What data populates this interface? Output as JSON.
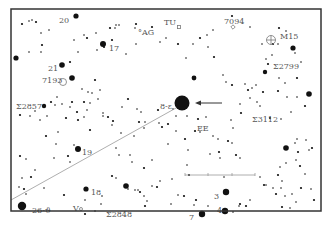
{
  "map": {
    "title": "Star finder chart",
    "frame": {
      "x": 11,
      "y": 9,
      "w": 310,
      "h": 202,
      "color": "#333333"
    },
    "ink_color": "#111111",
    "label_color": "#555555",
    "line_color": "#999999"
  },
  "labels": [
    {
      "id": "20",
      "text": "20",
      "x": 59,
      "y": 20
    },
    {
      "id": "AG",
      "text": "°AG",
      "x": 138,
      "y": 32
    },
    {
      "id": "TU",
      "text": "TU",
      "x": 164,
      "y": 22
    },
    {
      "id": "7094",
      "text": "7094",
      "x": 224,
      "y": 21
    },
    {
      "id": "M15",
      "text": "M15",
      "x": 280,
      "y": 36
    },
    {
      "id": "17",
      "text": "17",
      "x": 109,
      "y": 48
    },
    {
      "id": "21",
      "text": "21",
      "x": 48,
      "y": 68
    },
    {
      "id": "7193",
      "text": "7193",
      "x": 42,
      "y": 80
    },
    {
      "id": "S2799",
      "text": "Σ2799",
      "x": 273,
      "y": 66
    },
    {
      "id": "S2857",
      "text": "Σ2857",
      "x": 16,
      "y": 106
    },
    {
      "id": "8-eps",
      "text": "8-ε",
      "x": 160,
      "y": 106
    },
    {
      "id": "EE",
      "text": "EE",
      "x": 197,
      "y": 128
    },
    {
      "id": "S3112",
      "text": "Σ3112",
      "x": 252,
      "y": 119
    },
    {
      "id": "19",
      "text": "19",
      "x": 82,
      "y": 152
    },
    {
      "id": "18",
      "text": "18",
      "x": 91,
      "y": 192
    },
    {
      "id": "3",
      "text": "3",
      "x": 214,
      "y": 196
    },
    {
      "id": "V",
      "text": "V",
      "x": 73,
      "y": 208
    },
    {
      "id": "S2848",
      "text": "Σ2848",
      "x": 106,
      "y": 214
    },
    {
      "id": "26-theta",
      "text": "26-ϑ",
      "x": 32,
      "y": 210
    },
    {
      "id": "4",
      "text": "4",
      "x": 217,
      "y": 210
    },
    {
      "id": "7",
      "text": "7",
      "x": 189,
      "y": 217
    }
  ],
  "bright_stars": [
    {
      "x": 76,
      "y": 16,
      "r": 2.6
    },
    {
      "x": 103,
      "y": 44,
      "r": 3
    },
    {
      "x": 16,
      "y": 58,
      "r": 2.6
    },
    {
      "x": 62,
      "y": 65,
      "r": 2.8
    },
    {
      "x": 72,
      "y": 78,
      "r": 2.8
    },
    {
      "x": 182,
      "y": 103,
      "r": 7.5
    },
    {
      "x": 78,
      "y": 149,
      "r": 3
    },
    {
      "x": 22,
      "y": 206,
      "r": 4.2
    },
    {
      "x": 86,
      "y": 189,
      "r": 2.6
    },
    {
      "x": 126,
      "y": 186,
      "r": 2.8
    },
    {
      "x": 226,
      "y": 192,
      "r": 3.2
    },
    {
      "x": 225,
      "y": 211,
      "r": 3.2
    },
    {
      "x": 202,
      "y": 214,
      "r": 3.2
    },
    {
      "x": 293,
      "y": 48,
      "r": 2.6
    },
    {
      "x": 309,
      "y": 94,
      "r": 2.8
    },
    {
      "x": 286,
      "y": 148,
      "r": 2.8
    },
    {
      "x": 265,
      "y": 72,
      "r": 2.2
    },
    {
      "x": 194,
      "y": 78,
      "r": 2.4
    },
    {
      "x": 44,
      "y": 106,
      "r": 2.2
    }
  ],
  "faint_stars": [
    [
      22,
      24
    ],
    [
      29,
      21
    ],
    [
      32,
      20
    ],
    [
      36,
      22
    ],
    [
      41,
      33
    ],
    [
      49,
      30
    ],
    [
      42,
      45
    ],
    [
      41,
      52
    ],
    [
      29,
      52
    ],
    [
      70,
      62
    ],
    [
      78,
      52
    ],
    [
      74,
      40
    ],
    [
      87,
      38
    ],
    [
      84,
      35
    ],
    [
      96,
      33
    ],
    [
      110,
      28
    ],
    [
      116,
      25
    ],
    [
      119,
      25
    ],
    [
      136,
      24
    ],
    [
      135,
      28
    ],
    [
      136,
      44
    ],
    [
      104,
      47
    ],
    [
      97,
      50
    ],
    [
      126,
      54
    ],
    [
      152,
      27
    ],
    [
      166,
      38
    ],
    [
      160,
      42
    ],
    [
      178,
      44
    ],
    [
      186,
      58
    ],
    [
      193,
      44
    ],
    [
      200,
      38
    ],
    [
      208,
      47
    ],
    [
      213,
      30
    ],
    [
      232,
      16
    ],
    [
      250,
      27
    ],
    [
      262,
      44
    ],
    [
      273,
      44
    ],
    [
      278,
      44
    ],
    [
      286,
      31
    ],
    [
      279,
      28
    ],
    [
      272,
      55
    ],
    [
      266,
      59
    ],
    [
      268,
      64
    ],
    [
      295,
      53
    ],
    [
      301,
      62
    ],
    [
      297,
      78
    ],
    [
      285,
      83
    ],
    [
      279,
      78
    ],
    [
      278,
      91
    ],
    [
      287,
      97
    ],
    [
      297,
      97
    ],
    [
      305,
      106
    ],
    [
      291,
      112
    ],
    [
      281,
      119
    ],
    [
      270,
      118
    ],
    [
      260,
      106
    ],
    [
      257,
      102
    ],
    [
      248,
      90
    ],
    [
      252,
      88
    ],
    [
      256,
      85
    ],
    [
      263,
      92
    ],
    [
      250,
      98
    ],
    [
      207,
      35
    ],
    [
      214,
      57
    ],
    [
      223,
      75
    ],
    [
      226,
      82
    ],
    [
      232,
      85
    ],
    [
      245,
      84
    ],
    [
      240,
      104
    ],
    [
      241,
      113
    ],
    [
      231,
      120
    ],
    [
      206,
      117
    ],
    [
      198,
      119
    ],
    [
      187,
      116
    ],
    [
      176,
      116
    ],
    [
      168,
      124
    ],
    [
      213,
      136
    ],
    [
      218,
      139
    ],
    [
      228,
      141
    ],
    [
      232,
      143
    ],
    [
      240,
      158
    ],
    [
      236,
      155
    ],
    [
      233,
      128
    ],
    [
      176,
      131
    ],
    [
      185,
      139
    ],
    [
      188,
      150
    ],
    [
      187,
      165
    ],
    [
      189,
      175
    ],
    [
      172,
      179
    ],
    [
      178,
      195
    ],
    [
      184,
      196
    ],
    [
      171,
      204
    ],
    [
      194,
      205
    ],
    [
      196,
      200
    ],
    [
      208,
      206
    ],
    [
      233,
      212
    ],
    [
      240,
      204
    ],
    [
      239,
      206
    ],
    [
      260,
      177
    ],
    [
      264,
      185
    ],
    [
      266,
      185
    ],
    [
      273,
      188
    ],
    [
      278,
      175
    ],
    [
      282,
      181
    ],
    [
      281,
      188
    ],
    [
      276,
      194
    ],
    [
      285,
      196
    ],
    [
      292,
      194
    ],
    [
      301,
      188
    ],
    [
      296,
      202
    ],
    [
      290,
      208
    ],
    [
      282,
      207
    ],
    [
      295,
      143
    ],
    [
      297,
      139
    ],
    [
      298,
      152
    ],
    [
      306,
      140
    ],
    [
      309,
      150
    ],
    [
      312,
      148
    ],
    [
      88,
      92
    ],
    [
      92,
      93
    ],
    [
      95,
      80
    ],
    [
      100,
      90
    ],
    [
      82,
      89
    ],
    [
      84,
      102
    ],
    [
      90,
      103
    ],
    [
      87,
      110
    ],
    [
      77,
      112
    ],
    [
      70,
      107
    ],
    [
      57,
      97
    ],
    [
      51,
      102
    ],
    [
      55,
      105
    ],
    [
      62,
      104
    ],
    [
      72,
      102
    ],
    [
      47,
      116
    ],
    [
      35,
      111
    ],
    [
      20,
      115
    ],
    [
      30,
      116
    ],
    [
      122,
      107
    ],
    [
      128,
      99
    ],
    [
      137,
      109
    ],
    [
      141,
      112
    ],
    [
      113,
      121
    ],
    [
      112,
      125
    ],
    [
      134,
      136
    ],
    [
      139,
      122
    ],
    [
      145,
      122
    ],
    [
      159,
      123
    ],
    [
      162,
      127
    ],
    [
      119,
      155
    ],
    [
      130,
      155
    ],
    [
      144,
      168
    ],
    [
      152,
      160
    ],
    [
      168,
      144
    ],
    [
      20,
      156
    ],
    [
      26,
      159
    ],
    [
      35,
      170
    ],
    [
      31,
      177
    ],
    [
      22,
      178
    ],
    [
      19,
      187
    ],
    [
      24,
      189
    ],
    [
      26,
      194
    ],
    [
      44,
      188
    ],
    [
      64,
      195
    ],
    [
      85,
      200
    ],
    [
      102,
      196
    ],
    [
      85,
      214
    ],
    [
      101,
      204
    ],
    [
      95,
      211
    ],
    [
      112,
      176
    ],
    [
      116,
      178
    ],
    [
      128,
      189
    ],
    [
      140,
      192
    ],
    [
      144,
      196
    ],
    [
      147,
      201
    ],
    [
      145,
      206
    ],
    [
      135,
      190
    ],
    [
      138,
      190
    ],
    [
      157,
      187
    ],
    [
      160,
      181
    ],
    [
      152,
      186
    ],
    [
      112,
      40
    ],
    [
      115,
      28
    ],
    [
      98,
      99
    ],
    [
      90,
      130
    ],
    [
      116,
      148
    ],
    [
      132,
      162
    ],
    [
      46,
      136
    ],
    [
      56,
      144
    ],
    [
      54,
      158
    ],
    [
      68,
      156
    ],
    [
      70,
      162
    ],
    [
      74,
      145
    ],
    [
      78,
      120
    ],
    [
      58,
      132
    ],
    [
      40,
      120
    ],
    [
      66,
      118
    ],
    [
      84,
      117
    ],
    [
      103,
      116
    ],
    [
      108,
      117
    ],
    [
      121,
      133
    ],
    [
      144,
      128
    ],
    [
      158,
      110
    ],
    [
      173,
      109
    ],
    [
      103,
      113
    ],
    [
      195,
      131
    ],
    [
      200,
      132
    ],
    [
      210,
      154
    ],
    [
      219,
      152
    ],
    [
      220,
      158
    ],
    [
      224,
      177
    ],
    [
      246,
      206
    ],
    [
      250,
      200
    ],
    [
      296,
      160
    ],
    [
      300,
      166
    ],
    [
      305,
      174
    ],
    [
      311,
      189
    ],
    [
      314,
      200
    ],
    [
      286,
      163
    ],
    [
      280,
      167
    ]
  ],
  "open_markers": [
    {
      "type": "circle",
      "x": 63,
      "y": 82,
      "r": 3.5,
      "note": "7193"
    },
    {
      "type": "crosshair",
      "x": 271,
      "y": 40,
      "r": 4.5,
      "note": "M15"
    },
    {
      "type": "diamond",
      "x": 233,
      "y": 27,
      "r": 2.2,
      "note": "7094"
    },
    {
      "type": "square",
      "x": 179,
      "y": 27,
      "r": 1.6,
      "note": "TU"
    },
    {
      "type": "circle",
      "x": 81,
      "y": 209,
      "r": 1.5,
      "note": "V"
    }
  ],
  "guide_line": {
    "x1": 11,
    "y1": 200,
    "x2": 176,
    "y2": 108
  },
  "arrow": {
    "x1": 222,
    "y1": 103,
    "x2": 195,
    "y2": 103
  },
  "scale_bar": {
    "x1": 185,
    "y1": 175,
    "x2": 255,
    "y2": 175,
    "ticks": [
      185,
      208,
      232,
      255
    ]
  }
}
